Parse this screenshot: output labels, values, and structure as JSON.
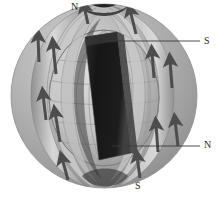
{
  "figure": {
    "width": 222,
    "height": 207,
    "background_color": "#ffffff"
  },
  "labels": [
    {
      "id": "n-top",
      "text": "N",
      "role": "pole-label",
      "position": "top-center",
      "leader": false
    },
    {
      "id": "s-right",
      "text": "S",
      "role": "pole-label",
      "position": "right-upper",
      "leader": true
    },
    {
      "id": "n-right",
      "text": "N",
      "role": "pole-label",
      "position": "right-lower",
      "leader": true
    },
    {
      "id": "s-bottom",
      "text": "S",
      "role": "pole-label",
      "position": "bottom-center",
      "leader": false
    }
  ],
  "colors": {
    "background": "#ffffff",
    "outer_sphere_light": "#c8c8c8",
    "outer_sphere_mid": "#a9a9a9",
    "outer_sphere_dark": "#8a8a8a",
    "inner_globe_light": "#d6d6d6",
    "inner_globe_mid": "#bdbdbd",
    "inner_globe_shadow": "#8f8f8f",
    "grid_line": "#9a9a9a",
    "bar_magnet": "#1f1f1f",
    "bar_magnet_edge": "#3a3a3a",
    "field_band_light": "#d2d2d2",
    "field_band_dark": "#4a4a4a",
    "arrow": "#4d4d4d",
    "leader_line": "#3a3a3a",
    "label_text": "#2b2b2b"
  },
  "elements": {
    "outer_sphere": "large shaded sphere representing the magnetosphere",
    "inner_globe": "gridded latitude-longitude globe",
    "bar_magnet": "dark tilted bar magnet through the globe centre",
    "field_bands": "curved ribbon field lines converging at the two poles",
    "field_arrows": "directional arrows along the field lines pointing toward the upper pole"
  }
}
